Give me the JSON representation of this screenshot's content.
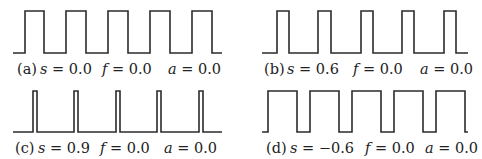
{
  "figure": {
    "panels": [
      {
        "id": "a",
        "label": "(a)",
        "s_var": "s",
        "s_value": "= 0.0",
        "f_var": "f",
        "f_value": "= 0.0",
        "a_var": "a",
        "a_value": "= 0.0",
        "params": {
          "s": 0.0,
          "f": 0.0,
          "a": 0.0
        },
        "wave": {
          "x_start": 13,
          "x_end": 222,
          "y_low": 53,
          "y_high": 11,
          "rises": [
            25,
            66,
            108,
            150,
            192
          ],
          "falls": [
            44,
            86,
            128,
            170,
            212
          ]
        },
        "caption_pos": {
          "left": 17,
          "top": 60
        },
        "offsets": {
          "s": 23,
          "f": 85,
          "a": 151
        }
      },
      {
        "id": "b",
        "label": "(b)",
        "s_var": "s",
        "s_value": "= 0.6",
        "f_var": "f",
        "f_value": "= 0.0",
        "a_var": "a",
        "a_value": "= 0.0",
        "params": {
          "s": 0.6,
          "f": 0.0,
          "a": 0.0
        },
        "wave": {
          "x_start": 262,
          "x_end": 468,
          "y_low": 53,
          "y_high": 11,
          "rises": [
            277,
            318,
            361,
            402,
            444
          ],
          "falls": [
            289,
            331,
            373,
            414,
            456
          ]
        },
        "caption_pos": {
          "left": 264,
          "top": 60
        },
        "offsets": {
          "s": 23,
          "f": 89,
          "a": 156
        }
      },
      {
        "id": "c",
        "label": "(c)",
        "s_var": "s",
        "s_value": "= 0.9",
        "f_var": "f",
        "f_value": "= 0.0",
        "a_var": "a",
        "a_value": "= 0.0",
        "params": {
          "s": 0.9,
          "f": 0.0,
          "a": 0.0
        },
        "wave": {
          "x_start": 13,
          "x_end": 222,
          "y_low": 132,
          "y_high": 91,
          "rises": [
            33,
            74,
            116,
            157,
            199
          ],
          "falls": [
            37,
            78,
            120,
            161,
            203
          ]
        },
        "caption_pos": {
          "left": 15,
          "top": 139
        },
        "offsets": {
          "s": 23,
          "f": 85,
          "a": 149
        }
      },
      {
        "id": "d",
        "label": "(d)",
        "s_var": "s",
        "s_value": "= −0.6",
        "f_var": "f",
        "f_value": "= 0.0",
        "a_var": "a",
        "a_value": "= 0.0",
        "params": {
          "s": -0.6,
          "f": 0.0,
          "a": 0.0
        },
        "wave": {
          "x_start": 262,
          "x_end": 468,
          "y_low": 132,
          "y_high": 91,
          "rises": [
            268,
            310,
            352,
            394,
            436
          ],
          "falls": [
            297,
            339,
            381,
            423,
            465
          ]
        },
        "caption_pos": {
          "left": 266,
          "top": 139
        },
        "offsets": {
          "s": 24,
          "f": 99,
          "a": 159
        }
      }
    ]
  },
  "style": {
    "stroke_color": "#2b2b2b",
    "text_color": "#222222",
    "background": "#ffffff"
  }
}
